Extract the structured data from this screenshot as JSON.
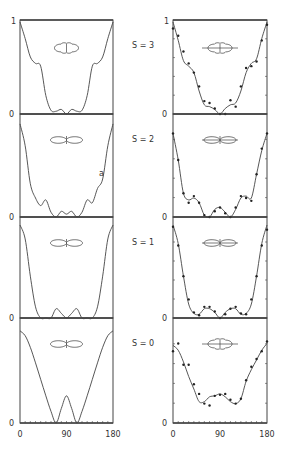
{
  "chart_data": [
    {
      "type": "line",
      "column": "left",
      "panel_label": "S = 3",
      "x_range": [
        0,
        180
      ],
      "ylim": [
        0,
        1
      ],
      "y_ticks": [
        "0",
        "1"
      ],
      "x": [
        0,
        10,
        20,
        30,
        40,
        50,
        60,
        70,
        80,
        90,
        100,
        110,
        120,
        130,
        140,
        150,
        160,
        170,
        180
      ],
      "series": [
        {
          "name": "calculated",
          "values": [
            1.0,
            0.82,
            0.62,
            0.55,
            0.52,
            0.2,
            0.04,
            0.03,
            0.05,
            0.0,
            0.05,
            0.03,
            0.04,
            0.2,
            0.52,
            0.55,
            0.62,
            0.82,
            1.0
          ]
        }
      ],
      "polar_inset": "four-lobed"
    },
    {
      "type": "line",
      "column": "left",
      "panel_label": "S = 2",
      "x_range": [
        0,
        180
      ],
      "ylim": [
        0,
        1
      ],
      "y_ticks": [
        "0"
      ],
      "x": [
        0,
        10,
        20,
        30,
        40,
        50,
        60,
        70,
        80,
        90,
        100,
        110,
        120,
        130,
        140,
        150,
        160,
        170,
        180
      ],
      "series": [
        {
          "name": "calculated",
          "values": [
            0.98,
            0.75,
            0.35,
            0.2,
            0.12,
            0.18,
            0.05,
            0.0,
            0.06,
            0.03,
            0.06,
            0.0,
            0.05,
            0.18,
            0.15,
            0.3,
            0.4,
            0.75,
            0.98
          ]
        }
      ],
      "annotation": "a",
      "polar_inset": "two-lobed"
    },
    {
      "type": "line",
      "column": "left",
      "panel_label": "S = 1",
      "x_range": [
        0,
        180
      ],
      "ylim": [
        0,
        1
      ],
      "y_ticks": [
        "0"
      ],
      "x": [
        0,
        10,
        20,
        30,
        40,
        50,
        60,
        70,
        80,
        90,
        100,
        110,
        120,
        130,
        140,
        150,
        160,
        170,
        180
      ],
      "series": [
        {
          "name": "calculated",
          "values": [
            1.0,
            0.85,
            0.45,
            0.12,
            0.0,
            0.0,
            0.0,
            0.1,
            0.05,
            0.0,
            0.05,
            0.1,
            0.0,
            0.0,
            0.0,
            0.12,
            0.45,
            0.85,
            1.0
          ]
        }
      ],
      "polar_inset": "two-lobed"
    },
    {
      "type": "line",
      "column": "left",
      "panel_label": "S = 0",
      "x_range": [
        0,
        180
      ],
      "ylim": [
        0,
        1
      ],
      "y_ticks": [
        "0"
      ],
      "x_ticks": [
        "0",
        "90",
        "180"
      ],
      "x": [
        0,
        10,
        20,
        30,
        40,
        50,
        60,
        70,
        80,
        90,
        100,
        110,
        120,
        130,
        140,
        150,
        160,
        170,
        180
      ],
      "series": [
        {
          "name": "calculated",
          "values": [
            0.95,
            0.9,
            0.78,
            0.62,
            0.45,
            0.28,
            0.12,
            0.0,
            0.15,
            0.28,
            0.15,
            0.0,
            0.12,
            0.28,
            0.45,
            0.62,
            0.78,
            0.9,
            0.95
          ]
        }
      ],
      "polar_inset": "two-lobed"
    },
    {
      "type": "line",
      "column": "right",
      "panel_label": "S = 3",
      "x_range": [
        0,
        180
      ],
      "ylim": [
        0,
        1
      ],
      "y_ticks": [
        "0",
        "1"
      ],
      "x": [
        0,
        10,
        20,
        30,
        40,
        50,
        60,
        70,
        80,
        90,
        100,
        110,
        120,
        130,
        140,
        150,
        160,
        170,
        180
      ],
      "series": [
        {
          "name": "calculated",
          "values": [
            1.0,
            0.8,
            0.58,
            0.52,
            0.45,
            0.25,
            0.1,
            0.08,
            0.05,
            0.0,
            0.06,
            0.1,
            0.12,
            0.25,
            0.45,
            0.55,
            0.6,
            0.82,
            1.0
          ]
        },
        {
          "name": "measured",
          "marker": "dot",
          "values": [
            0.93,
            0.85,
            0.68,
            0.55,
            0.45,
            0.3,
            0.14,
            0.12,
            0.06,
            0.0,
            0.0,
            0.15,
            0.08,
            0.3,
            0.5,
            0.52,
            0.57,
            0.8,
            0.97
          ]
        }
      ],
      "polar_inset": "four-lobed"
    },
    {
      "type": "line",
      "column": "right",
      "panel_label": "S = 2",
      "x_range": [
        0,
        180
      ],
      "ylim": [
        0,
        1
      ],
      "y_ticks": [
        "0"
      ],
      "x": [
        0,
        10,
        20,
        30,
        40,
        50,
        60,
        70,
        80,
        90,
        100,
        110,
        120,
        130,
        140,
        150,
        160,
        170,
        180
      ],
      "series": [
        {
          "name": "calculated",
          "values": [
            0.88,
            0.6,
            0.25,
            0.18,
            0.2,
            0.15,
            0.02,
            0.0,
            0.08,
            0.1,
            0.05,
            0.0,
            0.08,
            0.2,
            0.22,
            0.2,
            0.45,
            0.7,
            0.88
          ]
        },
        {
          "name": "measured",
          "marker": "dot",
          "values": [
            0.88,
            0.6,
            0.25,
            0.15,
            0.22,
            0.15,
            0.02,
            0.0,
            0.06,
            0.1,
            0.04,
            0.0,
            0.1,
            0.22,
            0.2,
            0.17,
            0.45,
            0.72,
            0.88
          ]
        }
      ],
      "polar_inset": "two-lobed"
    },
    {
      "type": "line",
      "column": "right",
      "panel_label": "S = 1",
      "x_range": [
        0,
        180
      ],
      "ylim": [
        0,
        1
      ],
      "y_ticks": [
        "0"
      ],
      "x": [
        0,
        10,
        20,
        30,
        40,
        50,
        60,
        70,
        80,
        90,
        100,
        110,
        120,
        130,
        140,
        150,
        160,
        170,
        180
      ],
      "series": [
        {
          "name": "calculated",
          "values": [
            1.0,
            0.8,
            0.45,
            0.15,
            0.05,
            0.04,
            0.1,
            0.1,
            0.06,
            0.0,
            0.06,
            0.1,
            0.1,
            0.04,
            0.05,
            0.15,
            0.45,
            0.8,
            1.0
          ]
        },
        {
          "name": "measured",
          "marker": "dot",
          "values": [
            0.98,
            0.78,
            0.45,
            0.2,
            0.06,
            0.03,
            0.12,
            0.12,
            0.07,
            0.0,
            0.04,
            0.1,
            0.12,
            0.05,
            0.04,
            0.2,
            0.45,
            0.78,
            0.95
          ]
        }
      ],
      "polar_inset": "two-lobed"
    },
    {
      "type": "line",
      "column": "right",
      "panel_label": "S = 0",
      "x_range": [
        0,
        180
      ],
      "ylim": [
        0,
        1
      ],
      "y_ticks": [
        "0"
      ],
      "x_ticks": [
        "0",
        "90",
        "180"
      ],
      "x": [
        0,
        10,
        20,
        30,
        40,
        50,
        60,
        70,
        80,
        90,
        100,
        110,
        120,
        130,
        140,
        150,
        160,
        170,
        180
      ],
      "series": [
        {
          "name": "calculated",
          "values": [
            0.8,
            0.75,
            0.63,
            0.48,
            0.35,
            0.22,
            0.22,
            0.27,
            0.28,
            0.3,
            0.27,
            0.22,
            0.2,
            0.25,
            0.43,
            0.55,
            0.65,
            0.75,
            0.82
          ]
        },
        {
          "name": "measured",
          "marker": "dot",
          "values": [
            0.74,
            0.82,
            0.6,
            0.6,
            0.4,
            0.3,
            0.2,
            0.18,
            0.28,
            0.29,
            0.3,
            0.24,
            0.2,
            0.25,
            0.44,
            0.58,
            0.66,
            0.74,
            0.84
          ]
        }
      ],
      "polar_inset": "four-lobed"
    }
  ]
}
